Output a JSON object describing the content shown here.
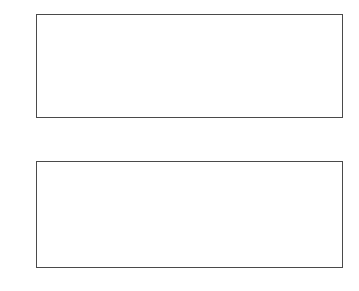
{
  "figure": {
    "background": "#ffffff",
    "axis_color": "#4a4a4a",
    "tick_label_color": "#1a1a1a",
    "curve_color": "#333333",
    "width": 359,
    "height": 291
  },
  "chart_data": [
    {
      "id": "top-subplot",
      "type": "line",
      "title": "",
      "xlabel": "",
      "ylabel": "",
      "xlim": [
        -1,
        1
      ],
      "ylim": [
        -1,
        1
      ],
      "grid": false,
      "legend": "none",
      "box": true,
      "tick_direction": "in",
      "xticks": [
        -1,
        -0.8,
        -0.6,
        -0.4,
        -0.2,
        0,
        0.2,
        0.4,
        0.6,
        0.8,
        1
      ],
      "xticklabels": [
        "-1",
        "-0.8",
        "-0.6",
        "-0.4",
        "-0.2",
        "0",
        "0.2",
        "0.4",
        "0.6",
        "0.8",
        "1"
      ],
      "yticks": [
        -1,
        -0.5,
        0,
        0.5,
        1
      ],
      "yticklabels": [
        "-1",
        "-0.5",
        "0",
        "0.5",
        "1"
      ],
      "description": "Chebyshev polynomials of the first kind, low degrees",
      "series": [
        {
          "name": "T1",
          "degree": 1,
          "kind": "chebyshev-T"
        },
        {
          "name": "T2",
          "degree": 2,
          "kind": "chebyshev-T"
        },
        {
          "name": "T3",
          "degree": 3,
          "kind": "chebyshev-T"
        },
        {
          "name": "T4",
          "degree": 4,
          "kind": "chebyshev-T"
        },
        {
          "name": "T5",
          "degree": 5,
          "kind": "chebyshev-T"
        }
      ],
      "samples": 400
    },
    {
      "id": "bottom-subplot",
      "type": "line",
      "title": "",
      "xlabel": "",
      "ylabel": "",
      "xlim": [
        -1,
        1
      ],
      "ylim": [
        -1,
        1
      ],
      "grid": false,
      "legend": "none",
      "box": true,
      "tick_direction": "in",
      "xticks": [
        -1,
        -0.8,
        -0.6,
        -0.4,
        -0.2,
        0,
        0.2,
        0.4,
        0.6,
        0.8,
        1
      ],
      "xticklabels": [
        "-1",
        "-0.8",
        "-0.6",
        "-0.4",
        "-0.2",
        "0",
        "0.2",
        "0.4",
        "0.6",
        "0.8",
        "1"
      ],
      "yticks": [
        -1,
        -0.5,
        0,
        0.5,
        1
      ],
      "yticklabels": [
        "-1",
        "-0.5",
        "0",
        "0.5",
        "1"
      ],
      "description": "Chebyshev polynomials of very high degree producing a dense aliased moire pattern with white lens-shaped voids",
      "series": [
        {
          "name": "T80",
          "degree": 80,
          "kind": "chebyshev-T"
        },
        {
          "name": "T81",
          "degree": 81,
          "kind": "chebyshev-T"
        },
        {
          "name": "T82",
          "degree": 82,
          "kind": "chebyshev-T"
        },
        {
          "name": "T83",
          "degree": 83,
          "kind": "chebyshev-T"
        },
        {
          "name": "T84",
          "degree": 84,
          "kind": "chebyshev-T"
        },
        {
          "name": "T85",
          "degree": 85,
          "kind": "chebyshev-T"
        },
        {
          "name": "T86",
          "degree": 86,
          "kind": "chebyshev-T"
        },
        {
          "name": "T87",
          "degree": 87,
          "kind": "chebyshev-T"
        },
        {
          "name": "T88",
          "degree": 88,
          "kind": "chebyshev-T"
        },
        {
          "name": "T89",
          "degree": 89,
          "kind": "chebyshev-T"
        },
        {
          "name": "T90",
          "degree": 90,
          "kind": "chebyshev-T"
        },
        {
          "name": "T91",
          "degree": 91,
          "kind": "chebyshev-T"
        },
        {
          "name": "T92",
          "degree": 92,
          "kind": "chebyshev-T"
        },
        {
          "name": "T93",
          "degree": 93,
          "kind": "chebyshev-T"
        },
        {
          "name": "T94",
          "degree": 94,
          "kind": "chebyshev-T"
        },
        {
          "name": "T95",
          "degree": 95,
          "kind": "chebyshev-T"
        },
        {
          "name": "T96",
          "degree": 96,
          "kind": "chebyshev-T"
        },
        {
          "name": "T97",
          "degree": 97,
          "kind": "chebyshev-T"
        },
        {
          "name": "T98",
          "degree": 98,
          "kind": "chebyshev-T"
        },
        {
          "name": "T99",
          "degree": 99,
          "kind": "chebyshev-T"
        }
      ],
      "samples": 1400
    }
  ]
}
